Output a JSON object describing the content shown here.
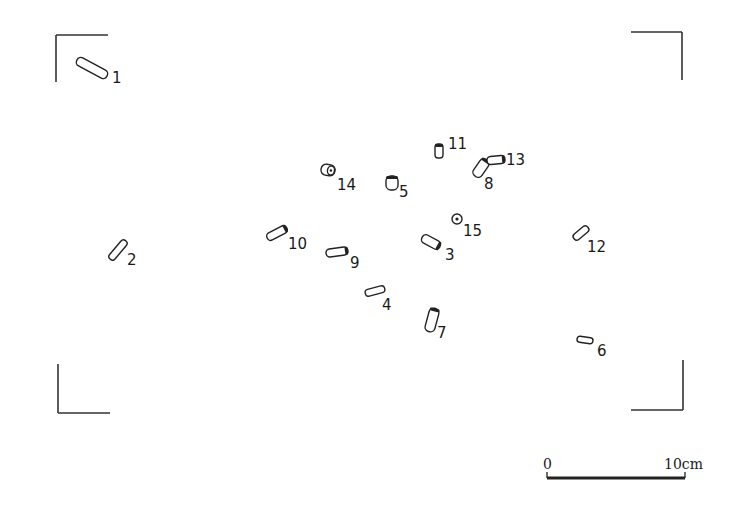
{
  "diagram": {
    "type": "artifact-distribution-plan",
    "frame_corners": [
      {
        "name": "top-left",
        "h": [
          56,
          35,
          108,
          35
        ],
        "v": [
          56,
          35,
          56,
          82
        ]
      },
      {
        "name": "top-right",
        "h": [
          631,
          32,
          682,
          32
        ],
        "v": [
          682,
          32,
          682,
          80
        ]
      },
      {
        "name": "bottom-left",
        "h": [
          58,
          413,
          110,
          413
        ],
        "v": [
          58,
          364,
          58,
          413
        ]
      },
      {
        "name": "bottom-right",
        "h": [
          631,
          410,
          683,
          410
        ],
        "v": [
          683,
          360,
          683,
          410
        ]
      }
    ],
    "objects": [
      {
        "id": "1",
        "label": "1",
        "cx": 92,
        "cy": 68,
        "w": 34,
        "h": 9,
        "angle": 28,
        "end": false,
        "lx": 112,
        "ly": 83
      },
      {
        "id": "2",
        "label": "2",
        "cx": 118,
        "cy": 250,
        "w": 24,
        "h": 7,
        "angle": -50,
        "end": false,
        "lx": 127,
        "ly": 265
      },
      {
        "id": "3",
        "label": "3",
        "cx": 431,
        "cy": 242,
        "w": 20,
        "h": 9,
        "angle": 28,
        "end": true,
        "lx": 445,
        "ly": 260
      },
      {
        "id": "4",
        "label": "4",
        "cx": 375,
        "cy": 291,
        "w": 20,
        "h": 7,
        "angle": -15,
        "end": false,
        "lx": 382,
        "ly": 310
      },
      {
        "id": "5",
        "label": "5",
        "cx": 392,
        "cy": 183,
        "w": 12,
        "h": 14,
        "angle": 0,
        "end": true,
        "lx": 399,
        "ly": 197,
        "shape": "cap"
      },
      {
        "id": "6",
        "label": "6",
        "cx": 585,
        "cy": 340,
        "w": 16,
        "h": 6,
        "angle": 8,
        "end": false,
        "lx": 597,
        "ly": 356
      },
      {
        "id": "7",
        "label": "7",
        "cx": 432,
        "cy": 320,
        "w": 10,
        "h": 24,
        "angle": 15,
        "end": true,
        "lx": 437,
        "ly": 338
      },
      {
        "id": "8",
        "label": "8",
        "cx": 481,
        "cy": 168,
        "w": 10,
        "h": 20,
        "angle": 35,
        "end": true,
        "lx": 484,
        "ly": 189
      },
      {
        "id": "9",
        "label": "9",
        "cx": 337,
        "cy": 252,
        "w": 22,
        "h": 8,
        "angle": -8,
        "end": true,
        "lx": 350,
        "ly": 268
      },
      {
        "id": "10",
        "label": "10",
        "cx": 277,
        "cy": 233,
        "w": 22,
        "h": 8,
        "angle": -28,
        "end": true,
        "lx": 288,
        "ly": 249
      },
      {
        "id": "11",
        "label": "11",
        "cx": 439,
        "cy": 151,
        "w": 8,
        "h": 14,
        "angle": 0,
        "end": true,
        "lx": 448,
        "ly": 149,
        "shape": "cap"
      },
      {
        "id": "12",
        "label": "12",
        "cx": 581,
        "cy": 233,
        "w": 18,
        "h": 7,
        "angle": -40,
        "end": false,
        "lx": 587,
        "ly": 252
      },
      {
        "id": "13",
        "label": "13",
        "cx": 496,
        "cy": 160,
        "w": 18,
        "h": 8,
        "angle": -5,
        "end": true,
        "lx": 506,
        "ly": 165
      },
      {
        "id": "14",
        "label": "14",
        "cx": 328,
        "cy": 170,
        "w": 14,
        "h": 11,
        "angle": 10,
        "end": false,
        "lx": 337,
        "ly": 190,
        "shape": "ring"
      },
      {
        "id": "15",
        "label": "15",
        "cx": 457,
        "cy": 219,
        "r": 5,
        "shape": "circle",
        "lx": 463,
        "ly": 236
      }
    ],
    "scale_bar": {
      "x1": 547,
      "x2": 685,
      "y": 478,
      "start_label": "0",
      "end_label": "10cm"
    }
  }
}
